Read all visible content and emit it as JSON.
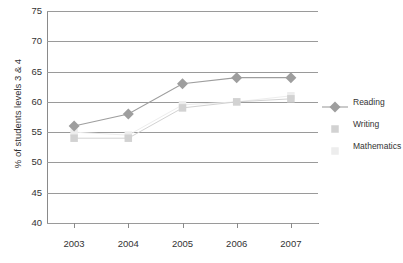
{
  "chart_data": {
    "type": "line",
    "title": "",
    "xlabel": "",
    "ylabel": "% of students levels 3 & 4",
    "categories": [
      "2003",
      "2004",
      "2005",
      "2006",
      "2007"
    ],
    "ylim": [
      40,
      75
    ],
    "yticks": [
      40,
      45,
      50,
      55,
      60,
      65,
      70,
      75
    ],
    "grid": true,
    "legend_position": "right",
    "series": [
      {
        "name": "Reading",
        "values": [
          56,
          58,
          63,
          64,
          64
        ],
        "color": "#9e9e9e",
        "marker": "diamond"
      },
      {
        "name": "Writing",
        "values": [
          54,
          54,
          59,
          60,
          60.5
        ],
        "color": "#d2d2d2",
        "marker": "square"
      },
      {
        "name": "Mathematics",
        "values": [
          55,
          54.5,
          59.5,
          60,
          61
        ],
        "color": "#ededed",
        "marker": "square"
      }
    ]
  },
  "axis": {
    "y_tick_labels": [
      "40",
      "45",
      "50",
      "55",
      "60",
      "65",
      "70",
      "75"
    ],
    "x_tick_labels": [
      "2003",
      "2004",
      "2005",
      "2006",
      "2007"
    ],
    "y_axis_title": "% of students levels 3 & 4"
  },
  "legend": {
    "items": [
      {
        "label": "Reading"
      },
      {
        "label": "Writing"
      },
      {
        "label": "Mathematics"
      }
    ]
  }
}
